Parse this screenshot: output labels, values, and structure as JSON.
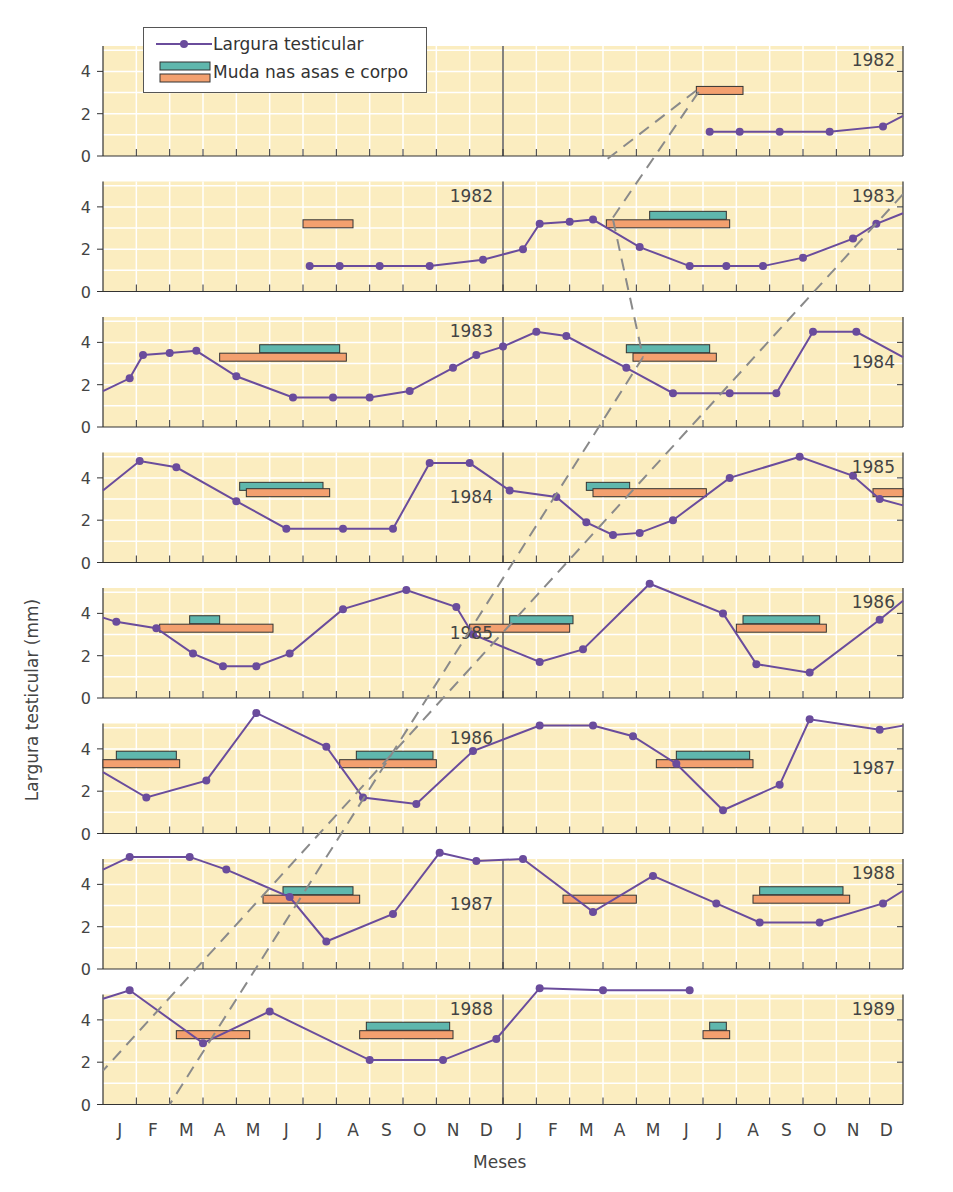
{
  "chart_data": {
    "type": "line",
    "title": "",
    "xlabel": "Meses",
    "ylabel": "Largura testicular (mm)",
    "legend": {
      "position": "top-left",
      "entries": [
        {
          "label": "Largura testicular",
          "kind": "line-marker",
          "color": "#6a4c9c"
        },
        {
          "label": "Muda nas asas e corpo",
          "kind": "bar",
          "color": "#5fb7ad"
        },
        {
          "label": "",
          "kind": "bar",
          "color": "#f3a06f"
        }
      ]
    },
    "x_tick_labels": [
      "J",
      "F",
      "M",
      "A",
      "M",
      "J",
      "J",
      "A",
      "S",
      "O",
      "N",
      "D",
      "J",
      "F",
      "M",
      "A",
      "M",
      "J",
      "J",
      "A",
      "S",
      "O",
      "N",
      "D"
    ],
    "y_ticks": [
      0,
      2,
      4
    ],
    "ylim": [
      0,
      5.2
    ],
    "colors": {
      "panel_bg": "#fbedc0",
      "grid": "#ffffff",
      "line": "#6a4c9c",
      "molt_wing": "#5fb7ad",
      "molt_body": "#f3a06f",
      "dashed": "#8a8a8a",
      "axis": "#333333"
    },
    "panels": [
      {
        "left_year": "",
        "right_year": "1982",
        "left_year_pos": null,
        "right_year_pos": "top",
        "series": [
          [
            18.2,
            1.15
          ],
          [
            19.1,
            1.15
          ],
          [
            20.3,
            1.15
          ],
          [
            21.8,
            1.15
          ],
          [
            23.4,
            1.4
          ],
          [
            24,
            1.9
          ]
        ],
        "molt_body": [
          [
            17.8,
            19.2,
            3.1
          ]
        ],
        "molt_wing": []
      },
      {
        "left_year": "1982",
        "right_year": "1983",
        "left_year_pos": "top",
        "right_year_pos": "top",
        "series": [
          [
            6.2,
            1.2
          ],
          [
            7.1,
            1.2
          ],
          [
            8.3,
            1.2
          ],
          [
            9.8,
            1.2
          ],
          [
            11.4,
            1.5
          ],
          [
            12.6,
            2.0
          ],
          [
            13.1,
            3.2
          ],
          [
            14,
            3.3
          ],
          [
            14.7,
            3.4
          ],
          [
            16.1,
            2.1
          ],
          [
            17.6,
            1.2
          ],
          [
            18.7,
            1.2
          ],
          [
            19.8,
            1.2
          ],
          [
            21,
            1.6
          ],
          [
            22.5,
            2.5
          ],
          [
            23.2,
            3.2
          ],
          [
            24,
            3.7
          ]
        ],
        "molt_body": [
          [
            6,
            7.5,
            3.2
          ],
          [
            15.1,
            18.8,
            3.2
          ]
        ],
        "molt_wing": [
          [
            16.4,
            18.7,
            3.6
          ]
        ]
      },
      {
        "left_year": "1983",
        "right_year": "1984",
        "left_year_pos": "top",
        "right_year_pos": "mid",
        "series": [
          [
            0,
            1.7
          ],
          [
            0.8,
            2.3
          ],
          [
            1.2,
            3.4
          ],
          [
            2,
            3.5
          ],
          [
            2.8,
            3.6
          ],
          [
            4,
            2.4
          ],
          [
            5.7,
            1.4
          ],
          [
            6.9,
            1.4
          ],
          [
            8,
            1.4
          ],
          [
            9.2,
            1.7
          ],
          [
            10.5,
            2.8
          ],
          [
            11.2,
            3.4
          ],
          [
            12,
            3.8
          ],
          [
            13,
            4.5
          ],
          [
            13.9,
            4.3
          ],
          [
            15.7,
            2.8
          ],
          [
            17.1,
            1.6
          ],
          [
            18.8,
            1.6
          ],
          [
            20.2,
            1.6
          ],
          [
            21.3,
            4.5
          ],
          [
            22.6,
            4.5
          ],
          [
            24,
            3.3
          ]
        ],
        "molt_body": [
          [
            3.5,
            7.3,
            3.3
          ],
          [
            15.9,
            18.4,
            3.3
          ]
        ],
        "molt_wing": [
          [
            4.7,
            7.1,
            3.7
          ],
          [
            15.7,
            18.2,
            3.7
          ]
        ]
      },
      {
        "left_year": "1984",
        "right_year": "1985",
        "left_year_pos": "mid",
        "right_year_pos": "top",
        "series": [
          [
            0,
            3.4
          ],
          [
            1.1,
            4.8
          ],
          [
            2.2,
            4.5
          ],
          [
            4,
            2.9
          ],
          [
            5.5,
            1.6
          ],
          [
            7.2,
            1.6
          ],
          [
            8.7,
            1.6
          ],
          [
            9.8,
            4.7
          ],
          [
            11,
            4.7
          ],
          [
            12.2,
            3.4
          ],
          [
            13.6,
            3.1
          ],
          [
            14.5,
            1.9
          ],
          [
            15.3,
            1.3
          ],
          [
            16.1,
            1.4
          ],
          [
            17.1,
            2.0
          ],
          [
            18.8,
            4.0
          ],
          [
            20.9,
            5.0
          ],
          [
            22.5,
            4.1
          ],
          [
            23.3,
            3.0
          ],
          [
            24,
            2.7
          ]
        ],
        "molt_body": [
          [
            4.3,
            6.8,
            3.3
          ],
          [
            14.7,
            18.1,
            3.3
          ],
          [
            23.1,
            24,
            3.3
          ]
        ],
        "molt_wing": [
          [
            4.1,
            6.6,
            3.6
          ],
          [
            14.5,
            15.8,
            3.6
          ]
        ]
      },
      {
        "left_year": "1985",
        "right_year": "1986",
        "left_year_pos": "mid",
        "right_year_pos": "top",
        "series": [
          [
            0,
            3.8
          ],
          [
            0.4,
            3.6
          ],
          [
            1.6,
            3.3
          ],
          [
            2.7,
            2.1
          ],
          [
            3.6,
            1.5
          ],
          [
            4.6,
            1.5
          ],
          [
            5.6,
            2.1
          ],
          [
            7.2,
            4.2
          ],
          [
            9.1,
            5.1
          ],
          [
            10.6,
            4.3
          ],
          [
            11.1,
            3.0
          ],
          [
            13.1,
            1.7
          ],
          [
            14.4,
            2.3
          ],
          [
            16.4,
            5.4
          ],
          [
            18.6,
            4.0
          ],
          [
            19.6,
            1.6
          ],
          [
            21.2,
            1.2
          ],
          [
            23.3,
            3.7
          ],
          [
            24,
            4.6
          ]
        ],
        "molt_body": [
          [
            1.7,
            5.1,
            3.3
          ],
          [
            11,
            14,
            3.3
          ],
          [
            19,
            21.7,
            3.3
          ]
        ],
        "molt_wing": [
          [
            2.6,
            3.5,
            3.7
          ],
          [
            12.2,
            14.1,
            3.7
          ],
          [
            19.2,
            21.5,
            3.7
          ]
        ]
      },
      {
        "left_year": "1986",
        "right_year": "1987",
        "left_year_pos": "top",
        "right_year_pos": "mid",
        "series": [
          [
            0,
            2.9
          ],
          [
            1.3,
            1.7
          ],
          [
            3.1,
            2.5
          ],
          [
            4.6,
            5.7
          ],
          [
            6.7,
            4.1
          ],
          [
            7.8,
            1.7
          ],
          [
            9.4,
            1.4
          ],
          [
            11.1,
            3.9
          ],
          [
            13.1,
            5.1
          ],
          [
            14.7,
            5.1
          ],
          [
            15.9,
            4.6
          ],
          [
            17.2,
            3.3
          ],
          [
            18.6,
            1.1
          ],
          [
            20.3,
            2.3
          ],
          [
            21.2,
            5.4
          ],
          [
            23.3,
            4.9
          ],
          [
            24,
            5.1
          ]
        ],
        "molt_body": [
          [
            0,
            2.3,
            3.3
          ],
          [
            7.1,
            10,
            3.3
          ],
          [
            16.6,
            19.5,
            3.3
          ]
        ],
        "molt_wing": [
          [
            0.4,
            2.2,
            3.7
          ],
          [
            7.6,
            9.9,
            3.7
          ],
          [
            17.2,
            19.4,
            3.7
          ]
        ]
      },
      {
        "left_year": "1987",
        "right_year": "1988",
        "left_year_pos": "mid",
        "right_year_pos": "top",
        "series": [
          [
            0,
            4.7
          ],
          [
            0.8,
            5.3
          ],
          [
            2.6,
            5.3
          ],
          [
            3.7,
            4.7
          ],
          [
            5.6,
            3.4
          ],
          [
            6.7,
            1.3
          ],
          [
            8.7,
            2.6
          ],
          [
            10.1,
            5.5
          ],
          [
            11.2,
            5.1
          ],
          [
            12.6,
            5.2
          ],
          [
            14.7,
            2.7
          ],
          [
            16.5,
            4.4
          ],
          [
            18.4,
            3.1
          ],
          [
            19.7,
            2.2
          ],
          [
            21.5,
            2.2
          ],
          [
            23.4,
            3.1
          ],
          [
            24,
            3.7
          ]
        ],
        "molt_body": [
          [
            4.8,
            7.7,
            3.3
          ],
          [
            13.8,
            16.0,
            3.3
          ],
          [
            19.5,
            22.4,
            3.3
          ]
        ],
        "molt_wing": [
          [
            5.4,
            7.5,
            3.7
          ],
          [
            19.7,
            22.2,
            3.7
          ]
        ]
      },
      {
        "left_year": "1988",
        "right_year": "1989",
        "left_year_pos": "top",
        "right_year_pos": "top",
        "series": [
          [
            0,
            5.0
          ],
          [
            0.8,
            5.4
          ],
          [
            3.0,
            2.9
          ],
          [
            5.0,
            4.4
          ],
          [
            8.0,
            2.1
          ],
          [
            10.2,
            2.1
          ],
          [
            11.8,
            3.1
          ],
          [
            13.1,
            5.5
          ],
          [
            15.0,
            5.4
          ],
          [
            17.6,
            5.4
          ]
        ],
        "molt_body": [
          [
            2.2,
            4.4,
            3.3
          ],
          [
            7.7,
            10.5,
            3.3
          ],
          [
            18.0,
            18.8,
            3.3
          ]
        ],
        "molt_wing": [
          [
            7.9,
            10.4,
            3.7
          ],
          [
            18.2,
            18.7,
            3.7
          ]
        ]
      }
    ],
    "dashed_lines": [
      [
        [
          24,
          4.6,
          1
        ],
        [
          11.1,
          3.9,
          5
        ],
        [
          5.6,
          3.5,
          6
        ],
        [
          2.0,
          0,
          7
        ]
      ],
      [
        [
          15.3,
          3.6,
          1
        ],
        [
          17.1,
          3.2,
          1
        ],
        [
          16.1,
          3.1,
          2
        ],
        [
          15.3,
          3.3,
          2
        ],
        [
          17.1,
          1.3,
          2
        ]
      ]
    ]
  }
}
